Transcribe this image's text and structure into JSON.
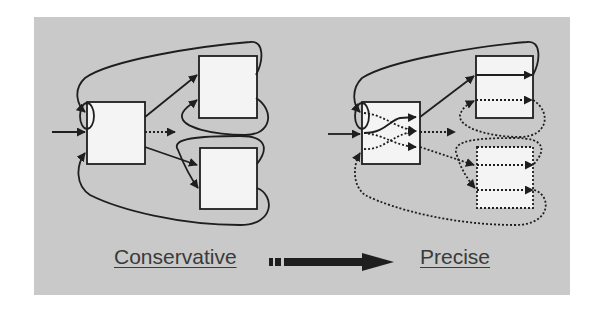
{
  "diagram": {
    "background_color": "#c9c9c9",
    "box_fill": "#f4f4f4",
    "line_color": "#1e1e1e",
    "left_panel": {
      "label": "Conservative",
      "nodes": [
        "source-box",
        "upper-target-box",
        "lower-target-box"
      ],
      "description": "Source box with single entry and three exits to two target boxes; feedback loops return to entry"
    },
    "right_panel": {
      "label": "Precise",
      "nodes": [
        "source-box",
        "upper-target-box",
        "lower-target-box-dotted"
      ],
      "description": "Source box with internal crossing paths; target boxes with separated solid/dotted internal paths"
    },
    "transition_arrow": {
      "from": "Conservative",
      "to": "Precise",
      "style": "dashed-start thick arrow"
    }
  }
}
